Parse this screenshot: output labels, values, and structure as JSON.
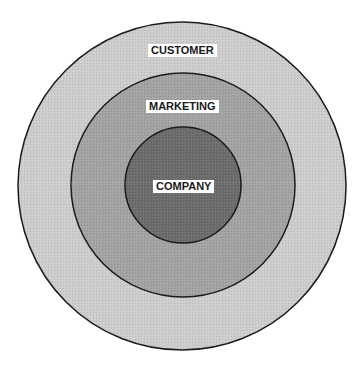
{
  "diagram": {
    "type": "concentric-circles",
    "rings": [
      {
        "id": "customer",
        "label": "CUSTOMER",
        "fill": "#cdcdcd",
        "cx": 182,
        "cy": 186,
        "r": 164
      },
      {
        "id": "marketing",
        "label": "MARKETING",
        "fill": "#a3a3a3",
        "cx": 183,
        "cy": 185,
        "r": 112
      },
      {
        "id": "company",
        "label": "COMPANY",
        "fill": "#6c6c6c",
        "cx": 183,
        "cy": 185,
        "r": 58
      }
    ],
    "stroke": "#1a1a1a"
  },
  "labels": {
    "customer": "CUSTOMER",
    "marketing": "MARKETING",
    "company": "COMPANY"
  }
}
